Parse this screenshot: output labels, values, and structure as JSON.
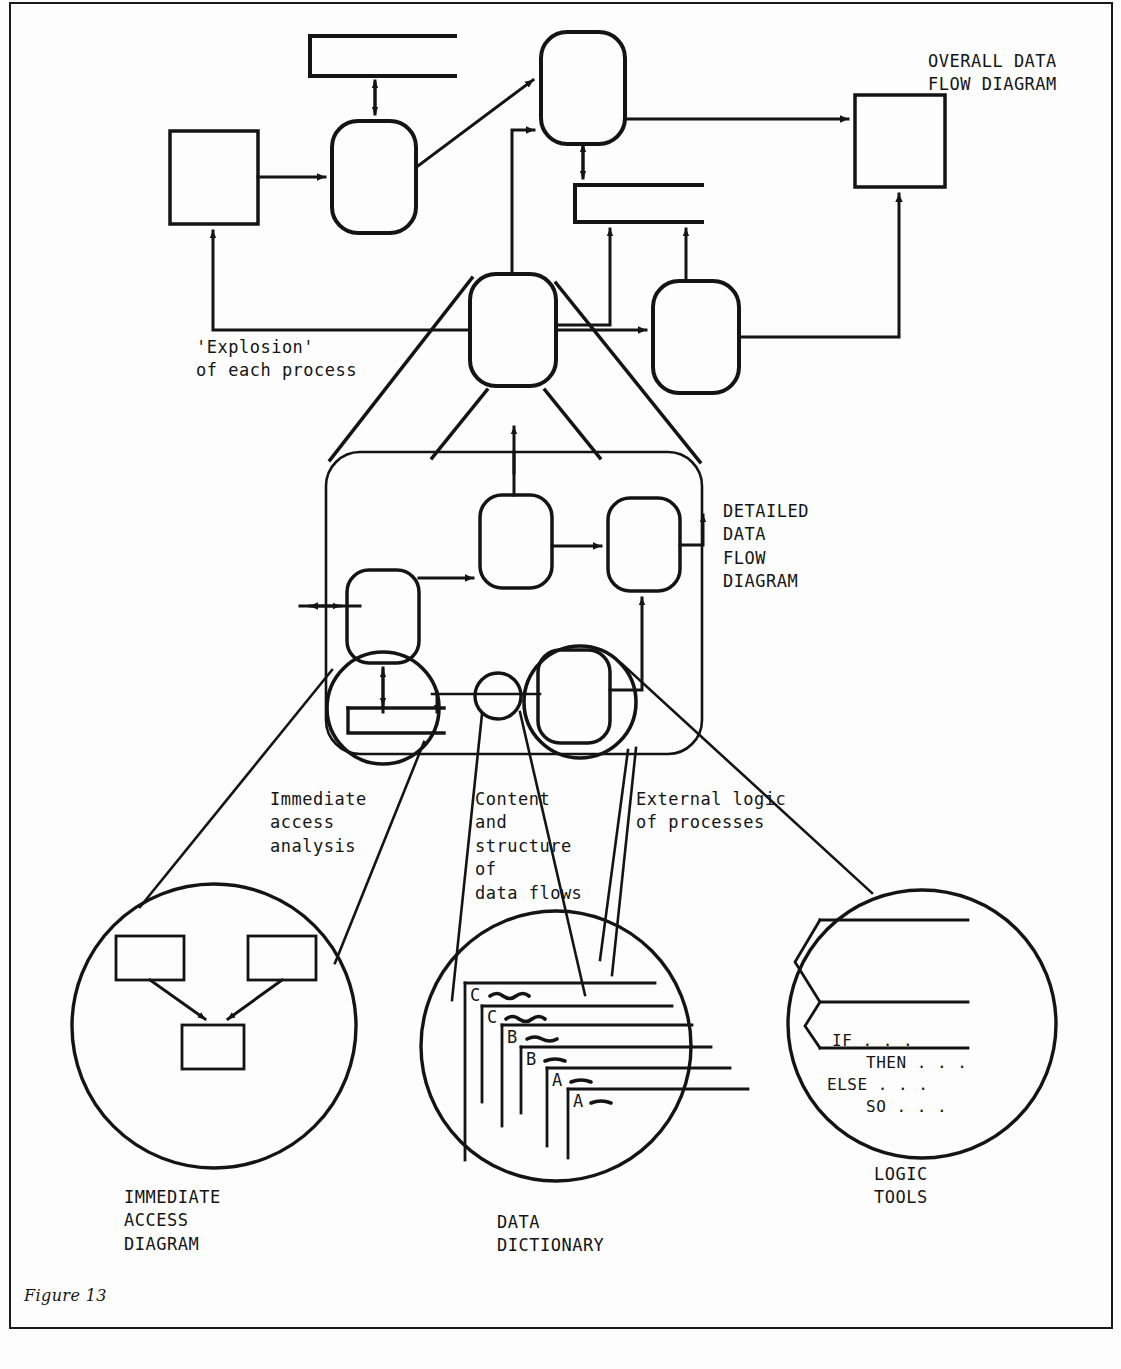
{
  "figure": {
    "caption": "Figure 13",
    "frame_visible": true
  },
  "labels": {
    "overall_dfd": "OVERALL DATA\nFLOW DIAGRAM",
    "explosion": "'Explosion'\nof each process",
    "detailed_dfd": "DETAILED\nDATA\nFLOW\nDIAGRAM",
    "immediate_access_analysis": "Immediate\naccess\nanalysis",
    "content_structure": "Content\nand\nstructure\nof\ndata flows",
    "external_logic": "External logic\nof processes",
    "immediate_access_diagram": "IMMEDIATE\nACCESS\nDIAGRAM",
    "data_dictionary": "DATA\nDICTIONARY",
    "logic_tools": "LOGIC\nTOOLS"
  },
  "logic_tools_text": {
    "line1": "IF . . .",
    "line2": "THEN . . .",
    "line3": "ELSE . . .",
    "line4": "SO . . ."
  },
  "data_dictionary_cards": [
    {
      "letter": "C"
    },
    {
      "letter": "C"
    },
    {
      "letter": "B"
    },
    {
      "letter": "B"
    },
    {
      "letter": "A"
    },
    {
      "letter": "A"
    }
  ],
  "colors": {
    "ink": "#141414",
    "paper": "#fdfdfd"
  },
  "diagram": {
    "type": "hierarchical structured-systems-analysis overview",
    "levels": [
      "Overall data flow diagram",
      "Detailed data flow diagram",
      "Immediate access diagram / Data dictionary / Logic tools"
    ]
  }
}
